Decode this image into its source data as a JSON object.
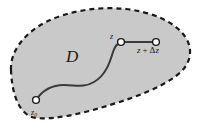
{
  "figure": {
    "background_color": "#ffffff",
    "region": {
      "name": "D",
      "label": "D",
      "fill_color": "#c9c9c9",
      "boundary_color": "#1a1a1a",
      "boundary_style": "dashed",
      "boundary_dash": "5,4",
      "boundary_width": 2.2
    },
    "path": {
      "color": "#3a3a3a",
      "width": 2.0,
      "description": "smooth S-shaped contour from z0 to z"
    },
    "segment": {
      "color": "#3a3a3a",
      "width": 2.0,
      "description": "straight increment segment from z to z + delta z"
    },
    "points": [
      {
        "id": "z0",
        "label": "z",
        "subscript": "0",
        "x": 36,
        "y": 100,
        "marker": "open-circle",
        "marker_fill": "#ffffff",
        "marker_stroke": "#1a1a1a",
        "radius": 3.4
      },
      {
        "id": "z",
        "label": "z",
        "subscript": "",
        "x": 121,
        "y": 42,
        "marker": "open-circle",
        "marker_fill": "#ffffff",
        "marker_stroke": "#1a1a1a",
        "radius": 3.4
      },
      {
        "id": "z_plus_dz",
        "label": "z + Δz",
        "subscript": "",
        "x": 156,
        "y": 42,
        "marker": "open-circle",
        "marker_fill": "#ffffff",
        "marker_stroke": "#1a1a1a",
        "radius": 3.4
      }
    ],
    "labels": {
      "region": "D",
      "start_point": "z",
      "start_point_subscript": "0",
      "end_point": "z",
      "increment_variable": "z",
      "increment_operator": "+",
      "increment_delta": "Δ",
      "increment_delta_variable": "z"
    }
  }
}
